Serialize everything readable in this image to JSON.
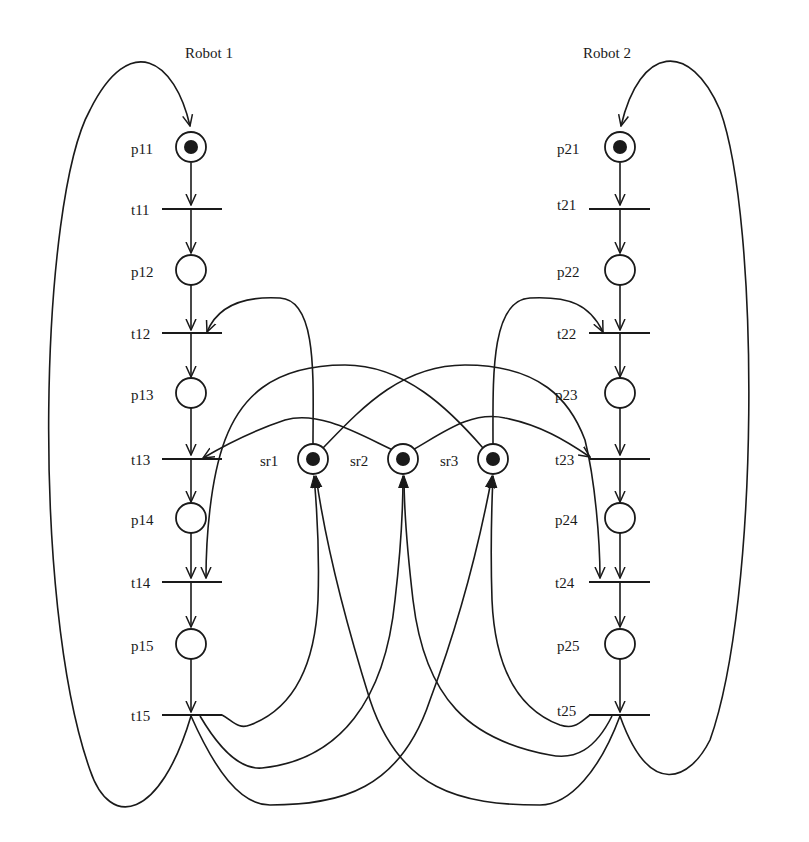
{
  "diagram": {
    "type": "petri-net",
    "titles": {
      "robot1": "Robot 1",
      "robot2": "Robot 2"
    },
    "robot1": {
      "places": [
        {
          "id": "p11",
          "label": "p11",
          "marked": true
        },
        {
          "id": "p12",
          "label": "p12",
          "marked": false
        },
        {
          "id": "p13",
          "label": "p13",
          "marked": false
        },
        {
          "id": "p14",
          "label": "p14",
          "marked": false
        },
        {
          "id": "p15",
          "label": "p15",
          "marked": false
        }
      ],
      "transitions": [
        {
          "id": "t11",
          "label": "t11"
        },
        {
          "id": "t12",
          "label": "t12"
        },
        {
          "id": "t13",
          "label": "t13"
        },
        {
          "id": "t14",
          "label": "t14"
        },
        {
          "id": "t15",
          "label": "t15"
        }
      ]
    },
    "robot2": {
      "places": [
        {
          "id": "p21",
          "label": "p21",
          "marked": true
        },
        {
          "id": "p22",
          "label": "p22",
          "marked": false
        },
        {
          "id": "p23",
          "label": "p23",
          "marked": false
        },
        {
          "id": "p24",
          "label": "p24",
          "marked": false
        },
        {
          "id": "p25",
          "label": "p25",
          "marked": false
        }
      ],
      "transitions": [
        {
          "id": "t21",
          "label": "t21"
        },
        {
          "id": "t22",
          "label": "t22"
        },
        {
          "id": "t23",
          "label": "t23"
        },
        {
          "id": "t24",
          "label": "t24"
        },
        {
          "id": "t25",
          "label": "t25"
        }
      ]
    },
    "shared_resources": [
      {
        "id": "sr1",
        "label": "sr1",
        "marked": true
      },
      {
        "id": "sr2",
        "label": "sr2",
        "marked": true
      },
      {
        "id": "sr3",
        "label": "sr3",
        "marked": true
      }
    ],
    "arcs": [
      [
        "t15",
        "p11"
      ],
      [
        "p11",
        "t11"
      ],
      [
        "t11",
        "p12"
      ],
      [
        "p12",
        "t12"
      ],
      [
        "t12",
        "p13"
      ],
      [
        "p13",
        "t13"
      ],
      [
        "t13",
        "p14"
      ],
      [
        "p14",
        "t14"
      ],
      [
        "t14",
        "p15"
      ],
      [
        "p15",
        "t15"
      ],
      [
        "t25",
        "p21"
      ],
      [
        "p21",
        "t21"
      ],
      [
        "t21",
        "p22"
      ],
      [
        "p22",
        "t22"
      ],
      [
        "t22",
        "p23"
      ],
      [
        "p23",
        "t23"
      ],
      [
        "t23",
        "p24"
      ],
      [
        "p24",
        "t24"
      ],
      [
        "t24",
        "p25"
      ],
      [
        "p25",
        "t25"
      ],
      [
        "sr1",
        "t12"
      ],
      [
        "sr2",
        "t13"
      ],
      [
        "sr3",
        "t14"
      ],
      [
        "sr3",
        "t22"
      ],
      [
        "sr2",
        "t23"
      ],
      [
        "sr1",
        "t24"
      ],
      [
        "t15",
        "sr1"
      ],
      [
        "t15",
        "sr2"
      ],
      [
        "t15",
        "sr3"
      ],
      [
        "t25",
        "sr1"
      ],
      [
        "t25",
        "sr2"
      ],
      [
        "t25",
        "sr3"
      ]
    ]
  }
}
